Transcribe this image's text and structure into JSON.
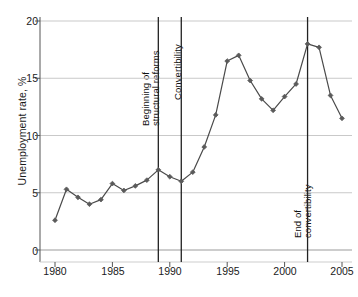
{
  "chart_data": {
    "type": "line",
    "title": "",
    "xlabel": "",
    "ylabel": "Unemployment rate, %",
    "xlim": [
      1979,
      2006
    ],
    "ylim": [
      0,
      20
    ],
    "xticks": [
      1980,
      1985,
      1990,
      1995,
      2000,
      2005
    ],
    "xtick_labels": [
      "1980",
      "1985",
      "1990",
      "1995",
      "2000",
      "2005"
    ],
    "yticks": [
      0,
      5,
      10,
      15,
      20
    ],
    "ytick_labels": [
      "0",
      "5",
      "10",
      "15",
      "20"
    ],
    "grid": "horizontal",
    "legend": "none",
    "marker": "diamond",
    "line_color": "#4a4a4a",
    "marker_color": "#5a5a5a",
    "grid_color": "#c9c9c9",
    "axis_color": "#555555",
    "x": [
      1980,
      1981,
      1982,
      1983,
      1984,
      1985,
      1986,
      1987,
      1988,
      1989,
      1990,
      1991,
      1992,
      1993,
      1994,
      1995,
      1996,
      1997,
      1998,
      1999,
      2000,
      2001,
      2002,
      2003,
      2004,
      2005
    ],
    "values": [
      2.6,
      5.3,
      4.6,
      4.0,
      4.4,
      5.8,
      5.2,
      5.6,
      6.1,
      7.0,
      6.4,
      6.0,
      6.8,
      9.0,
      11.8,
      16.5,
      17.0,
      14.8,
      13.2,
      12.2,
      13.4,
      14.5,
      18.0,
      17.7,
      13.5,
      11.5
    ],
    "annotations": [
      {
        "x": 1989,
        "label": "Beginning of\nstructural reforms",
        "line1": "Beginning of",
        "line2": "structural reforms"
      },
      {
        "x": 1991,
        "label": "Convertibility",
        "line1": "Convertibility",
        "line2": ""
      },
      {
        "x": 2002,
        "label": "End of\nconvertibility",
        "line1": "End of",
        "line2": "convertibility"
      }
    ],
    "last_point_note": "2005 value 8.0"
  },
  "axis": {
    "ylabel": "Unemployment rate, %"
  },
  "annotations": {
    "reforms_line1": "Beginning of",
    "reforms_line2": "structural reforms",
    "convertibility": "Convertibility",
    "end_line1": "End of",
    "end_line2": "convertibility"
  },
  "yticks": {
    "t0": "0",
    "t1": "5",
    "t2": "10",
    "t3": "15",
    "t4": "20"
  },
  "xticks": {
    "t0": "1980",
    "t1": "1985",
    "t2": "1990",
    "t3": "1995",
    "t4": "2000",
    "t5": "2005"
  }
}
